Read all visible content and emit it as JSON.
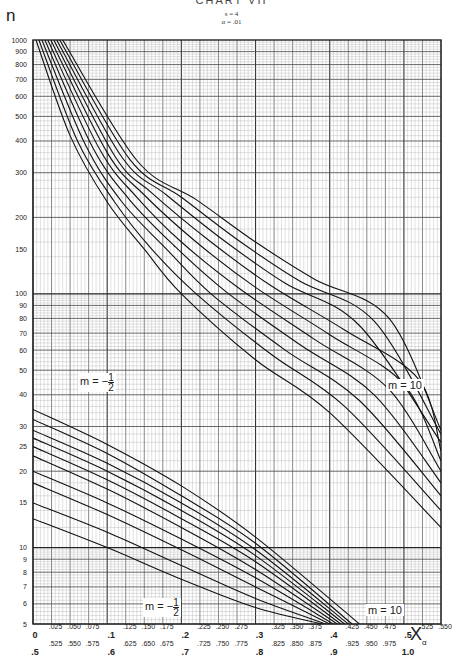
{
  "header": {
    "title": "CHART VII",
    "params": [
      "s = 4",
      "α = .01"
    ],
    "y_axis_symbol": "n",
    "x_axis_symbol": "X",
    "x_axis_subscript": "α"
  },
  "annotations": [
    {
      "text": "m = − 1/2",
      "label": "upper-family-m-minus-half"
    },
    {
      "text": "m = 10",
      "label": "upper-family-m-10"
    },
    {
      "text": "m = − 1/2",
      "label": "lower-family-m-minus-half"
    },
    {
      "text": "m = 10",
      "label": "lower-family-m-10"
    }
  ],
  "chart_data": {
    "type": "line",
    "title": "CHART VII",
    "subtitle": "s = 4, α = .01",
    "xlabel": "X_α",
    "ylabel": "n",
    "y_scale": "log",
    "ylim": [
      5,
      1000
    ],
    "xlim": [
      0,
      0.55
    ],
    "grid": true,
    "y_ticks": [
      5,
      6,
      7,
      8,
      9,
      10,
      15,
      20,
      25,
      30,
      40,
      50,
      60,
      70,
      80,
      90,
      100,
      150,
      200,
      300,
      400,
      500,
      600,
      700,
      800,
      900,
      1000
    ],
    "x_ticks_primary": [
      "0",
      ".025",
      ".050",
      ".075",
      ".1",
      ".125",
      ".150",
      ".175",
      ".2",
      ".225",
      ".250",
      ".275",
      ".3",
      ".325",
      ".350",
      ".375",
      ".4",
      ".425",
      ".450",
      ".475",
      ".5",
      ".525",
      ".550"
    ],
    "x_ticks_secondary": [
      ".5",
      ".525",
      ".550",
      ".575",
      ".6",
      ".625",
      ".650",
      ".675",
      ".7",
      ".725",
      ".750",
      ".775",
      ".8",
      ".825",
      ".850",
      ".875",
      ".9",
      ".925",
      ".950",
      ".975",
      "1.0"
    ],
    "series_upper": [
      {
        "name": "m = -1/2",
        "points": [
          [
            0.004,
            1000
          ],
          [
            0.05,
            420
          ],
          [
            0.1,
            230
          ],
          [
            0.15,
            150
          ],
          [
            0.2,
            100
          ],
          [
            0.3,
            55
          ],
          [
            0.4,
            34
          ],
          [
            0.55,
            12
          ]
        ]
      },
      {
        "name": "upper-2",
        "points": [
          [
            0.008,
            1000
          ],
          [
            0.06,
            400
          ],
          [
            0.11,
            230
          ],
          [
            0.16,
            150
          ],
          [
            0.22,
            100
          ],
          [
            0.32,
            58
          ],
          [
            0.42,
            36
          ],
          [
            0.55,
            14
          ]
        ]
      },
      {
        "name": "upper-3",
        "points": [
          [
            0.012,
            1000
          ],
          [
            0.07,
            390
          ],
          [
            0.12,
            230
          ],
          [
            0.18,
            150
          ],
          [
            0.24,
            100
          ],
          [
            0.34,
            60
          ],
          [
            0.44,
            38
          ],
          [
            0.55,
            16
          ]
        ]
      },
      {
        "name": "upper-4",
        "points": [
          [
            0.016,
            1000
          ],
          [
            0.08,
            380
          ],
          [
            0.13,
            235
          ],
          [
            0.19,
            155
          ],
          [
            0.26,
            102
          ],
          [
            0.36,
            63
          ],
          [
            0.46,
            40
          ],
          [
            0.55,
            18
          ]
        ]
      },
      {
        "name": "upper-5",
        "points": [
          [
            0.02,
            1000
          ],
          [
            0.09,
            370
          ],
          [
            0.14,
            240
          ],
          [
            0.2,
            160
          ],
          [
            0.28,
            104
          ],
          [
            0.38,
            66
          ],
          [
            0.48,
            42
          ],
          [
            0.55,
            20
          ]
        ]
      },
      {
        "name": "upper-6",
        "points": [
          [
            0.024,
            1000
          ],
          [
            0.1,
            360
          ],
          [
            0.15,
            245
          ],
          [
            0.22,
            160
          ],
          [
            0.3,
            106
          ],
          [
            0.4,
            69
          ],
          [
            0.5,
            44
          ],
          [
            0.55,
            22
          ]
        ]
      },
      {
        "name": "upper-7",
        "points": [
          [
            0.028,
            1000
          ],
          [
            0.11,
            350
          ],
          [
            0.16,
            250
          ],
          [
            0.24,
            160
          ],
          [
            0.32,
            108
          ],
          [
            0.42,
            72
          ],
          [
            0.52,
            46
          ],
          [
            0.55,
            24
          ]
        ]
      },
      {
        "name": "upper-8",
        "points": [
          [
            0.032,
            1000
          ],
          [
            0.12,
            345
          ],
          [
            0.18,
            245
          ],
          [
            0.26,
            160
          ],
          [
            0.34,
            110
          ],
          [
            0.44,
            75
          ],
          [
            0.55,
            26
          ]
        ]
      },
      {
        "name": "upper-9",
        "points": [
          [
            0.036,
            1000
          ],
          [
            0.13,
            340
          ],
          [
            0.2,
            240
          ],
          [
            0.28,
            160
          ],
          [
            0.36,
            112
          ],
          [
            0.46,
            78
          ],
          [
            0.55,
            28
          ]
        ]
      },
      {
        "name": "m = 10",
        "points": [
          [
            0.04,
            1000
          ],
          [
            0.14,
            335
          ],
          [
            0.22,
            235
          ],
          [
            0.3,
            160
          ],
          [
            0.38,
            114
          ],
          [
            0.48,
            80
          ],
          [
            0.55,
            29
          ]
        ]
      }
    ],
    "series_lower": [
      {
        "name": "m = -1/2",
        "points": [
          [
            0,
            13
          ],
          [
            0.1,
            10
          ],
          [
            0.2,
            7.5
          ],
          [
            0.3,
            5.8
          ],
          [
            0.39,
            5
          ]
        ]
      },
      {
        "name": "lower-2",
        "points": [
          [
            0,
            15
          ],
          [
            0.1,
            11.5
          ],
          [
            0.2,
            8.5
          ],
          [
            0.3,
            6.3
          ],
          [
            0.395,
            5
          ]
        ]
      },
      {
        "name": "lower-3",
        "points": [
          [
            0,
            18
          ],
          [
            0.1,
            13.5
          ],
          [
            0.2,
            9.8
          ],
          [
            0.3,
            7
          ],
          [
            0.4,
            5
          ]
        ]
      },
      {
        "name": "lower-4",
        "points": [
          [
            0,
            20
          ],
          [
            0.1,
            15
          ],
          [
            0.2,
            10.8
          ],
          [
            0.3,
            7.6
          ],
          [
            0.405,
            5
          ]
        ]
      },
      {
        "name": "lower-5",
        "points": [
          [
            0,
            23
          ],
          [
            0.1,
            17
          ],
          [
            0.2,
            12
          ],
          [
            0.3,
            8.2
          ],
          [
            0.41,
            5
          ]
        ]
      },
      {
        "name": "lower-6",
        "points": [
          [
            0,
            25
          ],
          [
            0.1,
            18.5
          ],
          [
            0.2,
            13
          ],
          [
            0.3,
            8.8
          ],
          [
            0.415,
            5
          ]
        ]
      },
      {
        "name": "lower-7",
        "points": [
          [
            0,
            27
          ],
          [
            0.1,
            20
          ],
          [
            0.2,
            14
          ],
          [
            0.3,
            9.3
          ],
          [
            0.42,
            5
          ]
        ]
      },
      {
        "name": "lower-8",
        "points": [
          [
            0,
            29
          ],
          [
            0.1,
            21.5
          ],
          [
            0.2,
            15
          ],
          [
            0.3,
            9.8
          ],
          [
            0.425,
            5
          ]
        ]
      },
      {
        "name": "lower-9",
        "points": [
          [
            0,
            32
          ],
          [
            0.1,
            23.5
          ],
          [
            0.2,
            16
          ],
          [
            0.3,
            10.4
          ],
          [
            0.43,
            5
          ]
        ]
      },
      {
        "name": "m = 10",
        "points": [
          [
            0,
            35
          ],
          [
            0.1,
            25.5
          ],
          [
            0.2,
            17.5
          ],
          [
            0.3,
            11
          ],
          [
            0.44,
            5
          ]
        ]
      }
    ]
  }
}
